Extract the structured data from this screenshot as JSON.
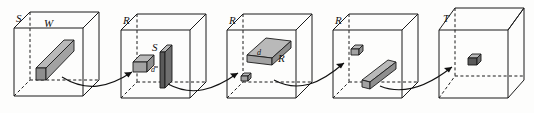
{
  "figure": {
    "panel_count": 5,
    "panels": [
      {
        "id": "panel-1",
        "corner_label": "S",
        "face_label": "W",
        "labels": [
          "S",
          "W"
        ],
        "contents": [
          "diagonal-bar"
        ],
        "object_count": 1
      },
      {
        "id": "panel-2",
        "corner_label": "R",
        "face_label": "S",
        "dimension_label": "d",
        "labels": [
          "R",
          "S",
          "d"
        ],
        "contents": [
          "small-cube",
          "vertical-plate"
        ],
        "object_count": 2
      },
      {
        "id": "panel-3",
        "corner_label": "R",
        "face_label": "R",
        "dimension_label": "d",
        "labels": [
          "R",
          "d",
          "R"
        ],
        "contents": [
          "small-cube",
          "flat-slab"
        ],
        "object_count": 2
      },
      {
        "id": "panel-4",
        "corner_label": "R",
        "labels": [
          "R"
        ],
        "contents": [
          "small-cube",
          "diagonal-bar"
        ],
        "object_count": 2
      },
      {
        "id": "panel-5",
        "corner_label": "T",
        "labels": [
          "T"
        ],
        "contents": [
          "small-cube"
        ],
        "object_count": 1
      }
    ],
    "arrows": [
      {
        "id": "arrow-1",
        "from": "panel-1",
        "to": "panel-2"
      },
      {
        "id": "arrow-2",
        "from": "panel-2",
        "to": "panel-3"
      },
      {
        "id": "arrow-3",
        "from": "panel-3",
        "to": "panel-4"
      },
      {
        "id": "arrow-4",
        "from": "panel-4",
        "to": "panel-5"
      }
    ],
    "colors": {
      "stroke": "#1a1a1a",
      "background": "#ffffff",
      "object_top": "#b9b9b9",
      "object_side": "#8e8e8e",
      "object_front": "#a2a2a2",
      "object_dark": "#6f6f6f",
      "object_darker": "#5a5a5a"
    }
  }
}
